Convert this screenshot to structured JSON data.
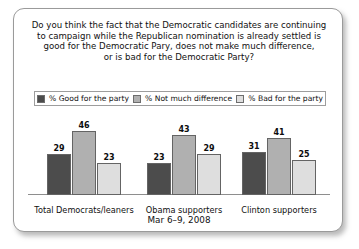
{
  "card": {
    "question_lines": [
      "Do you think the fact that the Democratic candidates are continuing",
      "to campaign while the Republican nomination is already settled is",
      "good for the Democratic Pary, does not make much difference,",
      "or is bad for the Democratic Party?"
    ],
    "footer": "Mar 6–9, 2008"
  },
  "colors": {
    "good": "#4c4c4c",
    "same": "#b0b0b0",
    "bad": "#dedede",
    "border": "#9a9a9a",
    "baseline": "#8e8e8e"
  },
  "chart_data": {
    "type": "bar",
    "subtitle": "Mar 6–9, 2008",
    "xlabel": "",
    "ylabel": "",
    "ylim": [
      0,
      50
    ],
    "grid": false,
    "legend_position": "top",
    "categories": [
      "Total Democrats/leaners",
      "Obama supporters",
      "Clinton supporters"
    ],
    "series": [
      {
        "name": "% Good for the party",
        "color": "#4c4c4c",
        "values": [
          29,
          23,
          31
        ]
      },
      {
        "name": "% Not much difference",
        "color": "#b0b0b0",
        "values": [
          46,
          43,
          41
        ]
      },
      {
        "name": "% Bad for the party",
        "color": "#dedede",
        "values": [
          23,
          29,
          25
        ]
      }
    ]
  }
}
